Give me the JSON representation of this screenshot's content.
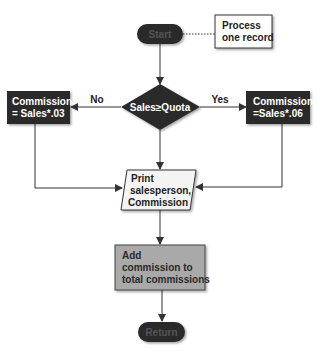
{
  "diagram": {
    "type": "flowchart",
    "nodes": {
      "start": {
        "label": "Start",
        "shape": "terminator"
      },
      "note": {
        "lines": [
          "Process",
          "one record"
        ],
        "shape": "annotation"
      },
      "decision": {
        "label": "Sales≥Quota",
        "shape": "decision"
      },
      "left": {
        "lines": [
          "Commission",
          "= Sales*.03"
        ],
        "shape": "process"
      },
      "right": {
        "lines": [
          "Commission",
          "=Sales*.06"
        ],
        "shape": "process"
      },
      "print": {
        "lines": [
          "Print",
          "salesperson,",
          "Commission"
        ],
        "shape": "input-output"
      },
      "add": {
        "lines": [
          "Add",
          "commission to",
          "total commissions"
        ],
        "shape": "process"
      },
      "return": {
        "label": "Return",
        "shape": "terminator"
      }
    },
    "edges": [
      {
        "from": "start",
        "to": "decision",
        "label": ""
      },
      {
        "from": "start",
        "to": "note",
        "label": "",
        "style": "dotted"
      },
      {
        "from": "decision",
        "to": "left",
        "label": "No"
      },
      {
        "from": "decision",
        "to": "right",
        "label": "Yes"
      },
      {
        "from": "decision",
        "to": "print",
        "label": ""
      },
      {
        "from": "left",
        "to": "print",
        "label": ""
      },
      {
        "from": "right",
        "to": "print",
        "label": ""
      },
      {
        "from": "print",
        "to": "add",
        "label": ""
      },
      {
        "from": "add",
        "to": "return",
        "label": ""
      }
    ],
    "colors": {
      "dark_fill": "#2b2b2b",
      "add_fill": "#a9a9a9",
      "line": "#333333",
      "light_fill": "#ffffff",
      "text_light": "#ffffff",
      "text_dark": "#222222"
    }
  }
}
